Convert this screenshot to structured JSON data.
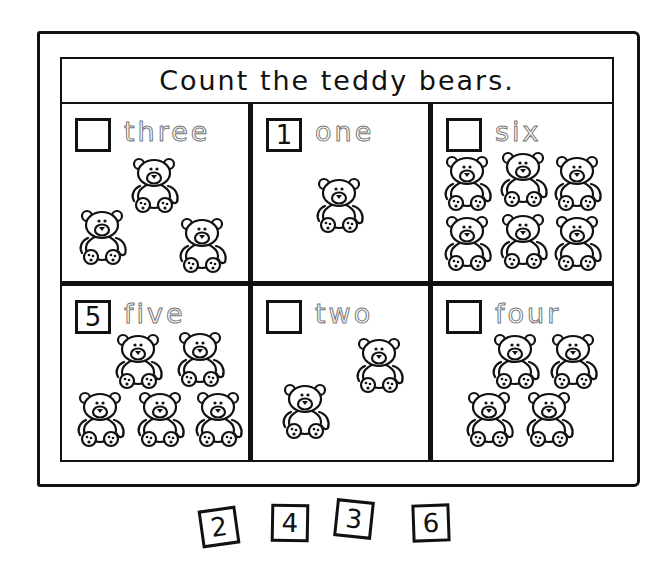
{
  "worksheet": {
    "title": "Count the teddy bears.",
    "cells": [
      {
        "word": "three",
        "answer": "",
        "bear_count": 3
      },
      {
        "word": "one",
        "answer": "1",
        "bear_count": 1
      },
      {
        "word": "six",
        "answer": "",
        "bear_count": 6
      },
      {
        "word": "five",
        "answer": "5",
        "bear_count": 5
      },
      {
        "word": "two",
        "answer": "",
        "bear_count": 2
      },
      {
        "word": "four",
        "answer": "",
        "bear_count": 4
      }
    ],
    "number_tiles": [
      "2",
      "4",
      "3",
      "6"
    ]
  },
  "colors": {
    "ink": "#111111",
    "trace": "#777777",
    "paper": "#ffffff"
  },
  "icons": {
    "bear": "teddy-bear-icon"
  }
}
